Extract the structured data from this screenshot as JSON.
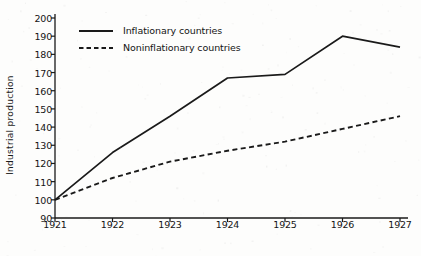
{
  "chart_data": {
    "type": "line",
    "title": "",
    "xlabel": "",
    "ylabel": "Industrial production",
    "x": [
      1921,
      1922,
      1923,
      1924,
      1925,
      1926,
      1927
    ],
    "categories": [
      "1921",
      "1922",
      "1923",
      "1924",
      "1925",
      "1926",
      "1927"
    ],
    "series": [
      {
        "name": "Inflationary countries",
        "style": "solid",
        "values": [
          100,
          126,
          146,
          167,
          169,
          190,
          184
        ]
      },
      {
        "name": "Noninflationary countries",
        "style": "dashed",
        "values": [
          100,
          112,
          121,
          127,
          132,
          139,
          146
        ]
      }
    ],
    "ylim": [
      90,
      200
    ],
    "xlim": [
      1921,
      1927
    ],
    "yticks": [
      90,
      100,
      110,
      120,
      130,
      140,
      150,
      160,
      170,
      180,
      190,
      200
    ],
    "ytick_labels": [
      "90",
      "100",
      "110",
      "120",
      "130",
      "140",
      "150",
      "160",
      "170",
      "180",
      "190",
      "200"
    ],
    "xtick_labels": [
      "1921",
      "1922",
      "1923",
      "1924",
      "1925",
      "1926",
      "1927"
    ],
    "grid": false,
    "legend_position": "top-left",
    "line_color": "#1a1a1a"
  },
  "legend": {
    "items": [
      {
        "label": "Inflationary countries",
        "style": "solid"
      },
      {
        "label": "Noninflationary countries",
        "style": "dashed"
      }
    ]
  }
}
